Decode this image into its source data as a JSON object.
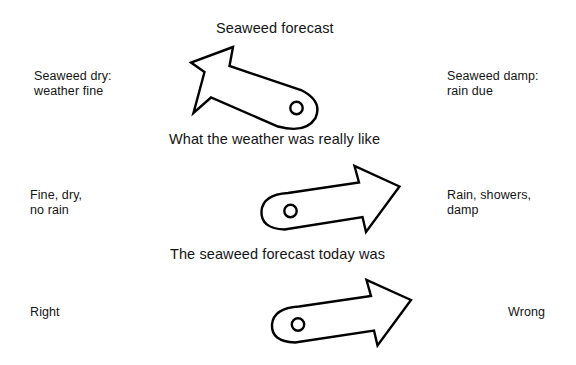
{
  "figure": {
    "title": "Seaweed forecast",
    "background_color": "#ffffff",
    "ink_color": "#000000"
  },
  "rows": [
    {
      "heading": "Seaweed forecast",
      "left_label": "Seaweed dry:\nweather fine",
      "right_label": "Seaweed damp:\nrain due",
      "pointer_direction": "up-left"
    },
    {
      "heading": "What the weather was really like",
      "left_label": "Fine, dry,\nno rain",
      "right_label": "Rain, showers,\ndamp",
      "pointer_direction": "up-right"
    },
    {
      "heading": "The seaweed forecast today was",
      "left_label": "Right",
      "right_label": "Wrong",
      "pointer_direction": "up-right"
    }
  ]
}
